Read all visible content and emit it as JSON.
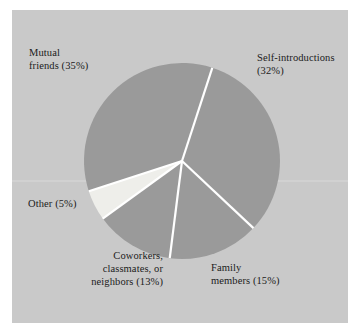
{
  "figure": {
    "panel_background": "#c9c9c9",
    "page_background": "#ffffff",
    "slice_fill": "#9a9a9a",
    "slice_fill_light": "#eeeeea",
    "separator_color": "#ffffff",
    "label_color": "#1b1b1b"
  },
  "labels": {
    "mutual_friends": "Mutual\nfriends (35%)",
    "self_introductions": "Self-introductions\n(32%)",
    "family_members": "Family\nmembers (15%)",
    "coworkers": "Coworkers,\nclassmates, or\nneighbors (13%)",
    "other": "Other (5%)"
  },
  "chart_data": {
    "type": "pie",
    "title": "",
    "subtitle": "",
    "xlabel": "",
    "ylabel": "",
    "grid": false,
    "legend_position": "none",
    "labels_inline": true,
    "start_angle_deg": -72,
    "direction": "clockwise",
    "center": {
      "x": 182,
      "y": 161
    },
    "radius": 98,
    "categories": [
      "Self-introductions",
      "Family members",
      "Coworkers, classmates, or neighbors",
      "Other",
      "Mutual friends"
    ],
    "values": [
      32,
      15,
      13,
      5,
      35
    ],
    "units": "percent",
    "total": 100,
    "slices": [
      {
        "name": "Self-introductions",
        "value": 32,
        "label": "Self-introductions (32%)",
        "color": "#9a9a9a",
        "start_deg": -72,
        "end_deg": 43.2
      },
      {
        "name": "Family members",
        "value": 15,
        "label": "Family members (15%)",
        "color": "#9a9a9a",
        "start_deg": 43.2,
        "end_deg": 97.2
      },
      {
        "name": "Coworkers, classmates, or neighbors",
        "value": 13,
        "label": "Coworkers, classmates, or neighbors (13%)",
        "color": "#9a9a9a",
        "start_deg": 97.2,
        "end_deg": 144.0
      },
      {
        "name": "Other",
        "value": 5,
        "label": "Other (5%)",
        "color": "#eeeeea",
        "start_deg": 144.0,
        "end_deg": 162.0
      },
      {
        "name": "Mutual friends",
        "value": 35,
        "label": "Mutual friends (35%)",
        "color": "#9a9a9a",
        "start_deg": 162.0,
        "end_deg": 288.0
      }
    ]
  }
}
